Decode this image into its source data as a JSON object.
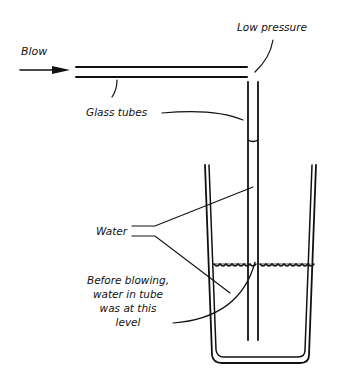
{
  "diagram": {
    "labels": {
      "blow": "Blow",
      "low_pressure": "Low pressure",
      "glass_tubes": "Glass tubes",
      "water": "Water",
      "before_line1": "Before blowing,",
      "before_line2": "water in tube",
      "before_line3": "was at this",
      "before_line4": "level"
    },
    "colors": {
      "ink": "#111111",
      "background": "#ffffff"
    }
  }
}
